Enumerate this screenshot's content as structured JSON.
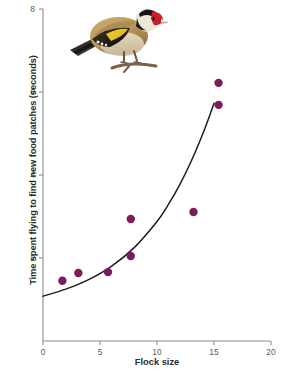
{
  "chart_data": {
    "type": "scatter",
    "title": "",
    "xlabel": "Flock size",
    "ylabel": "Time spent flying to find new food patches (seconds)",
    "xlim": [
      0,
      20
    ],
    "ylim": [
      0,
      8
    ],
    "xticks": [
      "0",
      "5",
      "10",
      "15",
      "20"
    ],
    "xtick_values": [
      0,
      5,
      10,
      15,
      20
    ],
    "yticks": [
      "2",
      "4",
      "6",
      "8"
    ],
    "ytick_values": [
      2,
      4,
      6,
      8
    ],
    "grid": false,
    "legend": null,
    "point_color": "#7B1C5E",
    "line_color": "#1e1e1e",
    "points": [
      {
        "x": 1.7,
        "y": 1.45
      },
      {
        "x": 3.1,
        "y": 1.64
      },
      {
        "x": 5.7,
        "y": 1.66
      },
      {
        "x": 7.7,
        "y": 2.05
      },
      {
        "x": 7.7,
        "y": 2.94
      },
      {
        "x": 13.2,
        "y": 3.11
      },
      {
        "x": 15.4,
        "y": 5.69
      },
      {
        "x": 15.4,
        "y": 6.22
      }
    ],
    "fit_curve": {
      "name": "exponential trend line",
      "points": [
        {
          "x": 0.0,
          "y": 1.08
        },
        {
          "x": 2.0,
          "y": 1.25
        },
        {
          "x": 4.0,
          "y": 1.48
        },
        {
          "x": 6.0,
          "y": 1.8
        },
        {
          "x": 8.0,
          "y": 2.25
        },
        {
          "x": 10.0,
          "y": 2.88
        },
        {
          "x": 11.0,
          "y": 3.29
        },
        {
          "x": 12.0,
          "y": 3.77
        },
        {
          "x": 13.0,
          "y": 4.33
        },
        {
          "x": 14.0,
          "y": 4.98
        },
        {
          "x": 14.8,
          "y": 5.57
        },
        {
          "x": 15.0,
          "y": 5.73
        }
      ]
    },
    "annotation_image": {
      "name": "european-goldfinch-photo",
      "description": "Photograph of a European goldfinch perched on a twig"
    }
  }
}
